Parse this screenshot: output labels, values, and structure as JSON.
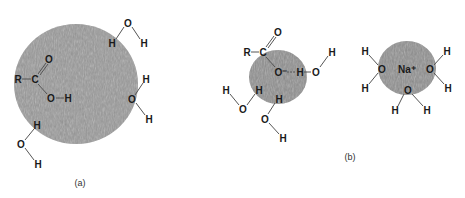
{
  "panels": [
    {
      "id": "a",
      "caption": "(a)",
      "particle": {
        "cx": 76,
        "cy": 84,
        "rx": 62,
        "ry": 60,
        "color": "#9a9a9a"
      },
      "atoms": [
        {
          "label": "R",
          "x": 18,
          "y": 79
        },
        {
          "label": "C",
          "x": 35,
          "y": 79
        },
        {
          "label": "O",
          "x": 49,
          "y": 59
        },
        {
          "label": "O",
          "x": 51,
          "y": 98
        },
        {
          "label": "H",
          "x": 68,
          "y": 98
        },
        {
          "label": "O",
          "x": 128,
          "y": 23
        },
        {
          "label": "H",
          "x": 112,
          "y": 43
        },
        {
          "label": "H",
          "x": 144,
          "y": 43
        },
        {
          "label": "H",
          "x": 146,
          "y": 79
        },
        {
          "label": "O",
          "x": 132,
          "y": 99
        },
        {
          "label": "H",
          "x": 149,
          "y": 119
        },
        {
          "label": "H",
          "x": 37,
          "y": 125
        },
        {
          "label": "O",
          "x": 21,
          "y": 144
        },
        {
          "label": "H",
          "x": 38,
          "y": 164
        }
      ],
      "caption_pos": {
        "x": 80,
        "y": 183
      }
    },
    {
      "id": "b-left",
      "particle": {
        "cx": 278,
        "cy": 77,
        "rx": 29,
        "ry": 27,
        "color": "#8f8f8f"
      },
      "atoms": [
        {
          "label": "O",
          "x": 278,
          "y": 32
        },
        {
          "label": "R",
          "x": 247,
          "y": 52
        },
        {
          "label": "C",
          "x": 263,
          "y": 52
        },
        {
          "label": "O⁻",
          "x": 281,
          "y": 72
        },
        {
          "label": "H",
          "x": 300,
          "y": 72
        },
        {
          "label": "O",
          "x": 316,
          "y": 72
        },
        {
          "label": "H",
          "x": 332,
          "y": 52
        },
        {
          "label": "H",
          "x": 226,
          "y": 90
        },
        {
          "label": "H",
          "x": 259,
          "y": 90
        },
        {
          "label": "O",
          "x": 243,
          "y": 109
        },
        {
          "label": "H",
          "x": 279,
          "y": 99
        },
        {
          "label": "O",
          "x": 265,
          "y": 119
        },
        {
          "label": "H",
          "x": 283,
          "y": 138
        }
      ]
    },
    {
      "id": "b-right",
      "caption": "(b)",
      "particle": {
        "cx": 407,
        "cy": 68,
        "rx": 29,
        "ry": 27,
        "color": "#8f8f8f"
      },
      "atoms": [
        {
          "label": "H",
          "x": 365,
          "y": 51
        },
        {
          "label": "O",
          "x": 382,
          "y": 69
        },
        {
          "label": "Na⁺",
          "x": 407,
          "y": 69
        },
        {
          "label": "O",
          "x": 430,
          "y": 69
        },
        {
          "label": "H",
          "x": 447,
          "y": 51
        },
        {
          "label": "H",
          "x": 365,
          "y": 88
        },
        {
          "label": "H",
          "x": 448,
          "y": 88
        },
        {
          "label": "O",
          "x": 408,
          "y": 90
        },
        {
          "label": "H",
          "x": 395,
          "y": 110
        },
        {
          "label": "H",
          "x": 427,
          "y": 110
        }
      ],
      "caption_pos": {
        "x": 350,
        "y": 157
      }
    }
  ]
}
